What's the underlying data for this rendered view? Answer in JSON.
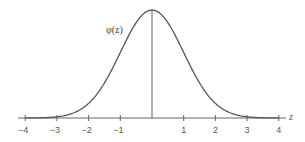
{
  "chart_data": {
    "type": "line",
    "curve_label": "φ(z)",
    "xlabel": "z",
    "ylabel": "",
    "xlim": [
      -4,
      4
    ],
    "x_ticks": [
      -4,
      -3,
      -2,
      -1,
      0,
      1,
      2,
      3,
      4
    ],
    "x_tick_labels": [
      "−4",
      "−3",
      "−2",
      "−1",
      "",
      "1",
      "2",
      "3",
      "4"
    ],
    "grid": false,
    "legend": null,
    "series": [
      {
        "name": "φ(z)",
        "x": [
          -4,
          -3.5,
          -3,
          -2.5,
          -2,
          -1.5,
          -1,
          -0.5,
          0,
          0.5,
          1,
          1.5,
          2,
          2.5,
          3,
          3.5,
          4
        ],
        "y": [
          0.0001,
          0.0009,
          0.0044,
          0.0175,
          0.054,
          0.1295,
          0.242,
          0.3521,
          0.3989,
          0.3521,
          0.242,
          0.1295,
          0.054,
          0.0175,
          0.0044,
          0.0009,
          0.0001
        ]
      }
    ],
    "annotations": [
      {
        "type": "vertical-line",
        "x": 0,
        "description": "line from peak to axis at z = 0"
      }
    ]
  },
  "colors": {
    "curve": "#555555",
    "axis": "#666666",
    "text": "#555555"
  }
}
